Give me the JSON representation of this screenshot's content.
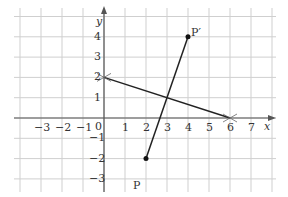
{
  "chart_data": {
    "type": "scatter",
    "title": "",
    "xlabel": "x",
    "ylabel": "y",
    "xlim": [
      -4,
      8
    ],
    "ylim": [
      -3.5,
      4.5
    ],
    "grid": true,
    "x_ticks": [
      "−3",
      "−2",
      "−1",
      "0",
      "1",
      "2",
      "3",
      "4",
      "5",
      "6",
      "7"
    ],
    "y_ticks": [
      "4",
      "3",
      "2",
      "1",
      "−1",
      "−2",
      "−3"
    ],
    "points": [
      {
        "label": "P",
        "x": 2,
        "y": -2
      },
      {
        "label": "P′",
        "x": 4,
        "y": 4
      }
    ],
    "segments": [
      {
        "name": "PP′",
        "from": [
          2,
          -2
        ],
        "to": [
          4,
          4
        ]
      },
      {
        "name": "mirror-line",
        "from": [
          0,
          2
        ],
        "to": [
          6,
          0
        ],
        "endpoints_marked": "cross"
      }
    ],
    "colors": {
      "grid": "#c8c8c8",
      "axis": "#555555",
      "line": "#222222"
    }
  },
  "labels": {
    "x_axis": "x",
    "y_axis": "y",
    "point_p": "P",
    "point_p_prime": "P′",
    "origin": "0",
    "xt": [
      "−3",
      "−2",
      "−1",
      "1",
      "2",
      "3",
      "4",
      "5",
      "6",
      "7"
    ],
    "yt": [
      "4",
      "3",
      "2",
      "1",
      "−1",
      "−2",
      "−3"
    ]
  }
}
